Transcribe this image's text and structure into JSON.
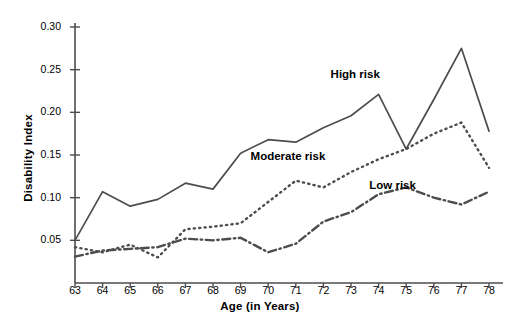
{
  "chart_data": {
    "type": "line",
    "title": "",
    "xlabel": "Age (in Years)",
    "ylabel": "Disability Index",
    "x": [
      63,
      64,
      65,
      66,
      67,
      68,
      69,
      70,
      71,
      72,
      73,
      74,
      75,
      76,
      77,
      78
    ],
    "xlim": [
      63,
      78
    ],
    "ylim": [
      0.0,
      0.3
    ],
    "yticks": [
      0.05,
      0.1,
      0.15,
      0.2,
      0.25,
      0.3
    ],
    "ytick_labels": [
      "0.05",
      "0.10",
      "0.15",
      "0.20",
      "0.25",
      "0.30"
    ],
    "xtick_labels": [
      "63",
      "64",
      "65",
      "66",
      "67",
      "68",
      "69",
      "70",
      "71",
      "72",
      "73",
      "74",
      "75",
      "76",
      "77",
      "78"
    ],
    "grid": false,
    "legend_position": "inline-annotations",
    "series": [
      {
        "name": "High risk",
        "style": "solid",
        "color": "#4d4d4d",
        "values": [
          0.05,
          0.107,
          0.09,
          0.098,
          0.117,
          0.11,
          0.152,
          0.168,
          0.165,
          0.182,
          0.196,
          0.221,
          0.157,
          0.215,
          0.275,
          0.178
        ],
        "label_x": 74,
        "label_y": 0.243
      },
      {
        "name": "Moderate risk",
        "style": "dotted",
        "color": "#4d4d4d",
        "values": [
          0.042,
          0.036,
          0.045,
          0.03,
          0.063,
          0.066,
          0.07,
          0.095,
          0.12,
          0.112,
          0.13,
          0.145,
          0.157,
          0.175,
          0.188,
          0.135
        ],
        "label_x": 71.1,
        "label_y": 0.147
      },
      {
        "name": "Low risk",
        "style": "dashdot",
        "color": "#4d4d4d",
        "values": [
          0.031,
          0.038,
          0.04,
          0.042,
          0.052,
          0.05,
          0.053,
          0.036,
          0.046,
          0.072,
          0.083,
          0.104,
          0.112,
          0.1,
          0.092,
          0.107
        ],
        "label_x": 75.4,
        "label_y": 0.113
      }
    ],
    "axis_color": "#4d4d4d"
  }
}
